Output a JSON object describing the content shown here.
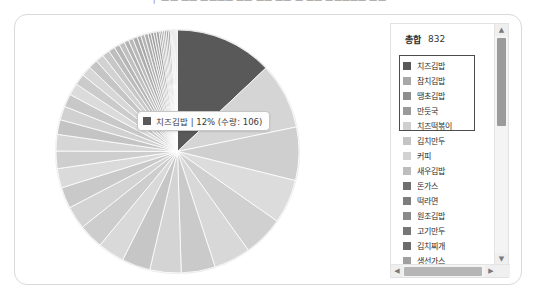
{
  "page": {
    "top_clipped_text": "ㅜ ㅡㅡ ㅡㅡ ㅡㅡㅡㅡ ㅡㅡ ㅡㅡ ㅡㅡ ㅡ ㅡㅡ ㅡㅡㅡㅡㅡ ㅡㅡ"
  },
  "legend": {
    "total_label": "총합",
    "total_value": "832",
    "scroll_up_icon": "▲",
    "scroll_down_icon": "▼",
    "scroll_left_icon": "◀",
    "scroll_right_icon": "▶",
    "items": [
      {
        "label": "치즈김밥",
        "color": "#595959",
        "selected": true
      },
      {
        "label": "참치김밥",
        "color": "#a8a8a8",
        "selected": true
      },
      {
        "label": "땡초김밥",
        "color": "#8e8e8e",
        "selected": true
      },
      {
        "label": "만둣국",
        "color": "#9a9a9a",
        "selected": true
      },
      {
        "label": "치즈떡볶이",
        "color": "#cfcfcf",
        "selected": true
      },
      {
        "label": "김치만두",
        "color": "#c4c4c4",
        "selected": false
      },
      {
        "label": "커피",
        "color": "#d2d2d2",
        "selected": false
      },
      {
        "label": "새우김밥",
        "color": "#bdbdbd",
        "selected": false
      },
      {
        "label": "돈가스",
        "color": "#6f6f6f",
        "selected": false
      },
      {
        "label": "떡라면",
        "color": "#7d7d7d",
        "selected": false
      },
      {
        "label": "원조김밥",
        "color": "#8a8a8a",
        "selected": false
      },
      {
        "label": "고기만두",
        "color": "#767676",
        "selected": false
      },
      {
        "label": "김치찌개",
        "color": "#6b6b6b",
        "selected": false
      },
      {
        "label": "생선가스",
        "color": "#a0a0a0",
        "selected": false
      },
      {
        "label": "오므라이스",
        "color": "#b0b0b0",
        "selected": false
      },
      {
        "label": "치킨마요덮밥",
        "color": "#8f8f8f",
        "selected": false
      }
    ]
  },
  "tooltip": {
    "swatch_color": "#595959",
    "text": "치즈김밥 | 12% (수량: 106)"
  },
  "chart_data": {
    "type": "pie",
    "title": "",
    "total_label": "총합",
    "total": 832,
    "value_unit": "수량",
    "highlighted_index": 0,
    "start_angle_deg": 0,
    "direction": "clockwise",
    "legend_position": "right",
    "labels": [
      "치즈김밥",
      "참치김밥",
      "땡초김밥",
      "만둣국",
      "치즈떡볶이",
      "김치만두",
      "커피",
      "새우김밥",
      "돈가스",
      "떡라면",
      "원조김밥",
      "고기만두",
      "김치찌개",
      "생선가스",
      "오므라이스",
      "치킨마요덮밥",
      "기타1",
      "기타2",
      "기타3",
      "기타4",
      "기타5",
      "기타6",
      "기타7",
      "기타8",
      "기타9",
      "기타10",
      "기타11",
      "기타12",
      "기타13",
      "기타14",
      "기타15",
      "기타16",
      "기타17",
      "기타18",
      "기타19",
      "기타20",
      "기타21",
      "기타22",
      "기타23",
      "기타24",
      "기타25",
      "기타26",
      "기타27",
      "기타28",
      "기타29",
      "기타30",
      "기타31",
      "기타32",
      "기타33",
      "기타34",
      "기타35",
      "기타36"
    ],
    "values": [
      106,
      72,
      58,
      48,
      44,
      40,
      37,
      34,
      31,
      29,
      27,
      25,
      23,
      21,
      19,
      18,
      16,
      15,
      14,
      13,
      12,
      11,
      10,
      9,
      8,
      7,
      6,
      6,
      5,
      5,
      5,
      4,
      4,
      4,
      3,
      3,
      3,
      3,
      2,
      2,
      2,
      2,
      2,
      2,
      1,
      1,
      1,
      1,
      1,
      1,
      1,
      1
    ],
    "percents": [
      12.7,
      8.7,
      7.0,
      5.8,
      5.3,
      4.8,
      4.4,
      4.1,
      3.7,
      3.5,
      3.2,
      3.0,
      2.8,
      2.5,
      2.3,
      2.2,
      1.9,
      1.8,
      1.7,
      1.6,
      1.4,
      1.3,
      1.2,
      1.1,
      1.0,
      0.8,
      0.7,
      0.7,
      0.6,
      0.6,
      0.6,
      0.5,
      0.5,
      0.5,
      0.4,
      0.4,
      0.4,
      0.4,
      0.2,
      0.2,
      0.2,
      0.2,
      0.2,
      0.2,
      0.1,
      0.1,
      0.1,
      0.1,
      0.1,
      0.1,
      0.1,
      0.1
    ],
    "colors": [
      "#595959",
      "#d5d5d5",
      "#cfcfcf",
      "#dcdcdc",
      "#d0d0d0",
      "#d8d8d8",
      "#cacaca",
      "#d4d4d4",
      "#c6c6c6",
      "#d9d9d9",
      "#cdcdcd",
      "#d3d3d3",
      "#c9c9c9",
      "#dadada",
      "#cecece",
      "#d6d6d6",
      "#c4c4c4",
      "#d1d1d1",
      "#c8c8c8",
      "#dbdbdb",
      "#cbcbcb",
      "#d7d7d7",
      "#c5c5c5",
      "#d2d2d2",
      "#c7c7c7",
      "#bdbdbd",
      "#b6b6b6",
      "#c0c0c0",
      "#b2b2b2",
      "#bababa",
      "#aeaeae",
      "#a8a8a8",
      "#b4b4b4",
      "#acacac",
      "#a4a4a4",
      "#9e9e9e",
      "#a9a9a9",
      "#a1a1a1",
      "#9a9a9a",
      "#969696",
      "#a6a6a6",
      "#9d9d9d",
      "#939393",
      "#8f8f8f",
      "#999999",
      "#8b8b8b",
      "#949494",
      "#8e8e8e",
      "#898989",
      "#919191",
      "#868686",
      "#8c8c8c"
    ]
  }
}
